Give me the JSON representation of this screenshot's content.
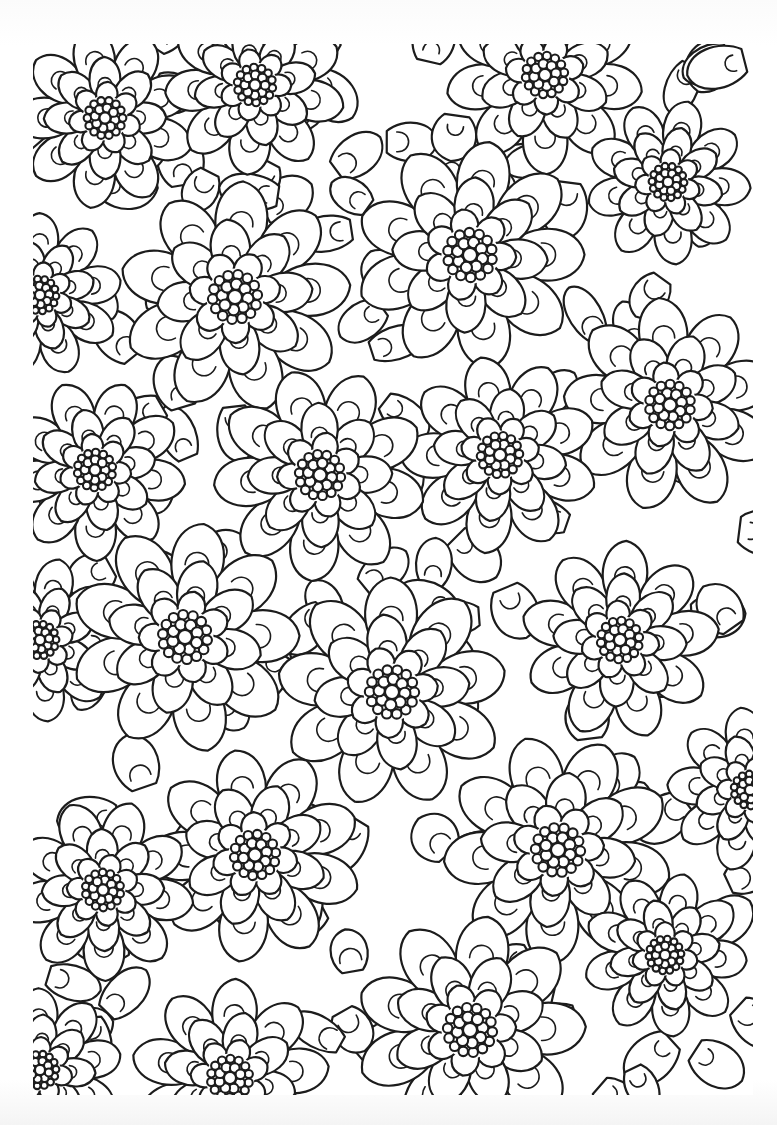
{
  "page": {
    "type": "coloring-book page",
    "background": "#ffffff",
    "line_color": "#1c1c1c",
    "line_width": 2.2
  },
  "art_frame": {
    "x": 33,
    "y": 44,
    "width": 720,
    "height": 1051
  },
  "flowers": [
    {
      "x": 105,
      "y": 118,
      "r": 22
    },
    {
      "x": 255,
      "y": 85,
      "r": 22
    },
    {
      "x": 545,
      "y": 75,
      "r": 24
    },
    {
      "x": 668,
      "y": 182,
      "r": 20
    },
    {
      "x": 470,
      "y": 255,
      "r": 28
    },
    {
      "x": 235,
      "y": 297,
      "r": 28
    },
    {
      "x": 40,
      "y": 295,
      "r": 20
    },
    {
      "x": 670,
      "y": 405,
      "r": 26
    },
    {
      "x": 500,
      "y": 455,
      "r": 24
    },
    {
      "x": 320,
      "y": 475,
      "r": 26
    },
    {
      "x": 95,
      "y": 470,
      "r": 22
    },
    {
      "x": 40,
      "y": 640,
      "r": 20
    },
    {
      "x": 185,
      "y": 637,
      "r": 28
    },
    {
      "x": 620,
      "y": 640,
      "r": 24
    },
    {
      "x": 392,
      "y": 692,
      "r": 28
    },
    {
      "x": 750,
      "y": 790,
      "r": 20
    },
    {
      "x": 255,
      "y": 855,
      "r": 26
    },
    {
      "x": 558,
      "y": 850,
      "r": 28
    },
    {
      "x": 103,
      "y": 890,
      "r": 22
    },
    {
      "x": 665,
      "y": 955,
      "r": 20
    },
    {
      "x": 470,
      "y": 1030,
      "r": 28
    },
    {
      "x": 230,
      "y": 1078,
      "r": 24
    },
    {
      "x": 40,
      "y": 1070,
      "r": 20
    }
  ]
}
